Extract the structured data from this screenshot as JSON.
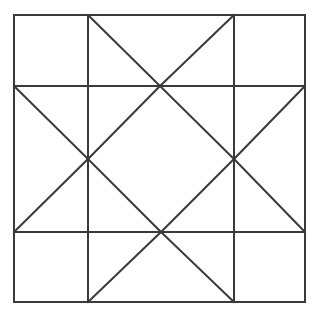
{
  "figure": {
    "type": "line-drawing",
    "width": 320,
    "height": 317,
    "background_color": "#ffffff",
    "stroke_color": "#3a3a3a",
    "stroke_width": 2,
    "bounds": {
      "left": 14,
      "top": 15,
      "right": 305,
      "bottom": 302
    },
    "grid": {
      "vertical_x": [
        88,
        234
      ],
      "horizontal_y": [
        86,
        232
      ]
    },
    "diamond": {
      "top": [
        160,
        86
      ],
      "left": [
        88,
        159
      ],
      "right": [
        234,
        159
      ],
      "bottom": [
        161,
        232
      ]
    },
    "outer_square": [
      {
        "name": "top-edge",
        "x1": 14,
        "y1": 15,
        "x2": 305,
        "y2": 15
      },
      {
        "name": "right-edge",
        "x1": 305,
        "y1": 15,
        "x2": 305,
        "y2": 302
      },
      {
        "name": "bottom-edge",
        "x1": 305,
        "y1": 302,
        "x2": 14,
        "y2": 302
      },
      {
        "name": "left-edge",
        "x1": 14,
        "y1": 302,
        "x2": 14,
        "y2": 15
      }
    ],
    "grid_lines": [
      {
        "name": "vertical-line-left",
        "x1": 88,
        "y1": 15,
        "x2": 88,
        "y2": 302
      },
      {
        "name": "vertical-line-right",
        "x1": 234,
        "y1": 15,
        "x2": 234,
        "y2": 302
      },
      {
        "name": "horizontal-line-upper",
        "x1": 14,
        "y1": 86,
        "x2": 305,
        "y2": 86
      },
      {
        "name": "horizontal-line-lower",
        "x1": 14,
        "y1": 232,
        "x2": 305,
        "y2": 232
      }
    ],
    "diamond_edges": [
      {
        "name": "diamond-edge-top-left",
        "x1": 160,
        "y1": 86,
        "x2": 88,
        "y2": 159
      },
      {
        "name": "diamond-edge-top-right",
        "x1": 160,
        "y1": 86,
        "x2": 234,
        "y2": 159
      },
      {
        "name": "diamond-edge-bottom-left",
        "x1": 88,
        "y1": 159,
        "x2": 161,
        "y2": 232
      },
      {
        "name": "diamond-edge-bottom-right",
        "x1": 234,
        "y1": 159,
        "x2": 161,
        "y2": 232
      }
    ],
    "star_diagonals": [
      {
        "name": "diagonal-top-left-up",
        "x1": 160,
        "y1": 86,
        "x2": 88,
        "y2": 15
      },
      {
        "name": "diagonal-top-right-up",
        "x1": 160,
        "y1": 86,
        "x2": 234,
        "y2": 15
      },
      {
        "name": "diagonal-left-upper-out",
        "x1": 88,
        "y1": 159,
        "x2": 14,
        "y2": 86
      },
      {
        "name": "diagonal-left-lower-out",
        "x1": 88,
        "y1": 159,
        "x2": 14,
        "y2": 232
      },
      {
        "name": "diagonal-right-upper-out",
        "x1": 234,
        "y1": 159,
        "x2": 305,
        "y2": 86
      },
      {
        "name": "diagonal-right-lower-out",
        "x1": 234,
        "y1": 159,
        "x2": 305,
        "y2": 232
      },
      {
        "name": "diagonal-bottom-left-down",
        "x1": 161,
        "y1": 232,
        "x2": 88,
        "y2": 302
      },
      {
        "name": "diagonal-bottom-right-down",
        "x1": 161,
        "y1": 232,
        "x2": 234,
        "y2": 302
      }
    ]
  }
}
